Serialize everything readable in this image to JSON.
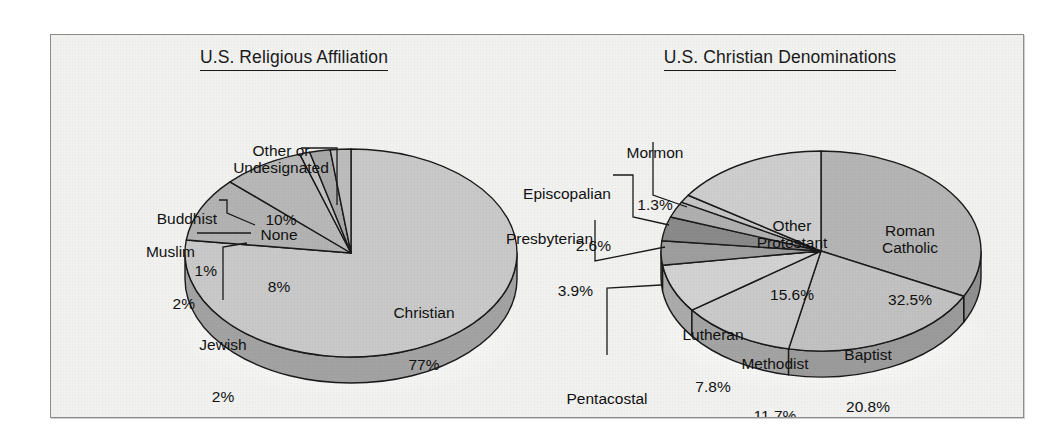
{
  "figure": {
    "background_color": "#f2f2f1",
    "frame_color": "#8d8d8d"
  },
  "chart_data": [
    {
      "type": "pie",
      "title": "U.S. Religious Affiliation",
      "chart_id": "us-religious-affiliation",
      "units": "percent",
      "three_d": true,
      "legend_position": "callout-labels",
      "categories": [
        "Christian",
        "Other or Undesignated",
        "None",
        "Buddhist",
        "Muslim",
        "Jewish"
      ],
      "values": [
        77,
        10,
        8,
        1,
        2,
        2
      ],
      "slices": [
        {
          "name": "Christian",
          "pct_label": "77%",
          "value": 77,
          "fill": "#c9c9c9",
          "side": "#a3a3a3"
        },
        {
          "name": "Other or\nUndesignated",
          "pct_label": "10%",
          "value": 10,
          "fill": "#b3b3b3",
          "side": "#8f8f8f"
        },
        {
          "name": "None",
          "pct_label": "8%",
          "value": 8,
          "fill": "#b8b8b8",
          "side": "#949494"
        },
        {
          "name": "Buddhist",
          "pct_label": "1%",
          "value": 1,
          "fill": "#c2c2c2",
          "side": "#9c9c9c"
        },
        {
          "name": "Muslim",
          "pct_label": "2%",
          "value": 2,
          "fill": "#a8a8a8",
          "side": "#868686"
        },
        {
          "name": "Jewish",
          "pct_label": "2%",
          "value": 2,
          "fill": "#bdbdbd",
          "side": "#999999"
        }
      ]
    },
    {
      "type": "pie",
      "title": "U.S. Christian Denominations",
      "chart_id": "us-christian-denominations",
      "units": "percent",
      "three_d": true,
      "legend_position": "callout-labels",
      "categories": [
        "Roman Catholic",
        "Baptist",
        "Methodist",
        "Lutheran",
        "Pentacostal",
        "Presbyterian",
        "Episcopalian",
        "Mormon",
        "Other Protestant"
      ],
      "values": [
        32.5,
        20.8,
        11.7,
        7.8,
        3.9,
        3.9,
        2.6,
        1.3,
        15.6
      ],
      "slices": [
        {
          "name": "Roman\nCatholic",
          "pct_label": "32.5%",
          "value": 32.5,
          "fill": "#b5b5b5",
          "side": "#909090"
        },
        {
          "name": "Baptist",
          "pct_label": "20.8%",
          "value": 20.8,
          "fill": "#c2c2c2",
          "side": "#9b9b9b"
        },
        {
          "name": "Methodist",
          "pct_label": "11.7%",
          "value": 11.7,
          "fill": "#cacaca",
          "side": "#a4a4a4"
        },
        {
          "name": "Lutheran",
          "pct_label": "7.8%",
          "value": 7.8,
          "fill": "#d2d2d2",
          "side": "#ababab"
        },
        {
          "name": "Pentacostal",
          "pct_label": "3.9%",
          "value": 3.9,
          "fill": "#9e9e9e",
          "side": "#7d7d7d"
        },
        {
          "name": "Presbyterian",
          "pct_label": "3.9%",
          "value": 3.9,
          "fill": "#8a8a8a",
          "side": "#6d6d6d"
        },
        {
          "name": "Episcopalian",
          "pct_label": "2.6%",
          "value": 2.6,
          "fill": "#b0b0b0",
          "side": "#8c8c8c"
        },
        {
          "name": "Mormon",
          "pct_label": "1.3%",
          "value": 1.3,
          "fill": "#c6c6c6",
          "side": "#9f9f9f"
        },
        {
          "name": "Other\nProtestant",
          "pct_label": "15.6%",
          "value": 15.6,
          "fill": "#cecece",
          "side": "#a7a7a7"
        }
      ]
    }
  ],
  "left": {
    "title": "U.S. Religious Affiliation",
    "labels": {
      "other": {
        "name": "Other or\nUndesignated",
        "pct": "10%"
      },
      "buddhist": {
        "name": "Buddhist",
        "pct": "1%"
      },
      "muslim": {
        "name": "Muslim",
        "pct": "2%"
      },
      "jewish": {
        "name": "Jewish",
        "pct": "2%"
      },
      "none": {
        "name": "None",
        "pct": "8%"
      },
      "christian": {
        "name": "Christian",
        "pct": "77%"
      }
    }
  },
  "right": {
    "title": "U.S. Christian Denominations",
    "labels": {
      "mormon": {
        "name": "Mormon",
        "pct": "1.3%"
      },
      "episcopalian": {
        "name": "Episcopalian",
        "pct": "2.6%"
      },
      "presbyterian": {
        "name": "Presbyterian",
        "pct": "3.9%"
      },
      "pentacostal": {
        "name": "Pentacostal",
        "pct": "3.9%"
      },
      "lutheran": {
        "name": "Lutheran",
        "pct": "7.8%"
      },
      "methodist": {
        "name": "Methodist",
        "pct": "11.7%"
      },
      "baptist": {
        "name": "Baptist",
        "pct": "20.8%"
      },
      "roman_catholic": {
        "name": "Roman\nCatholic",
        "pct": "32.5%"
      },
      "other_protestant": {
        "name": "Other\nProtestant",
        "pct": "15.6%"
      }
    }
  }
}
